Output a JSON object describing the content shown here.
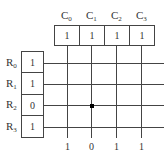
{
  "columns": [
    {
      "name": "C",
      "index": "0",
      "value": "1",
      "bottom": "1"
    },
    {
      "name": "C",
      "index": "1",
      "value": "1",
      "bottom": "0"
    },
    {
      "name": "C",
      "index": "2",
      "value": "1",
      "bottom": "1"
    },
    {
      "name": "C",
      "index": "3",
      "value": "1",
      "bottom": "1"
    }
  ],
  "rows": [
    {
      "name": "R",
      "index": "0",
      "value": "1"
    },
    {
      "name": "R",
      "index": "1",
      "value": "1"
    },
    {
      "name": "R",
      "index": "2",
      "value": "0"
    },
    {
      "name": "R",
      "index": "3",
      "value": "1"
    }
  ],
  "selected_cell": {
    "row": 2,
    "column": 1
  }
}
